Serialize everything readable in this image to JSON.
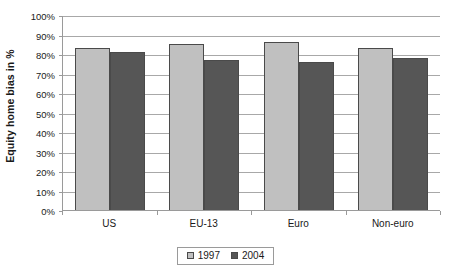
{
  "chart_data": {
    "type": "bar",
    "title": "",
    "xlabel": "",
    "ylabel": "Equity home bias in %",
    "categories": [
      "US",
      "EU-13",
      "Euro",
      "Non-euro"
    ],
    "series": [
      {
        "name": "1997",
        "color": "#c0c0c0",
        "values": [
          83,
          85,
          86,
          83
        ]
      },
      {
        "name": "2004",
        "color": "#565656",
        "values": [
          81,
          77,
          76,
          78
        ]
      }
    ],
    "ylim": [
      0,
      100
    ],
    "yticks": [
      0,
      10,
      20,
      30,
      40,
      50,
      60,
      70,
      80,
      90,
      100
    ],
    "ytick_labels": [
      "0%",
      "10%",
      "20%",
      "30%",
      "40%",
      "50%",
      "60%",
      "70%",
      "80%",
      "90%",
      "100%"
    ],
    "grid": true,
    "legend_position": "bottom-center",
    "legend_entries": [
      "1997",
      "2004"
    ]
  }
}
